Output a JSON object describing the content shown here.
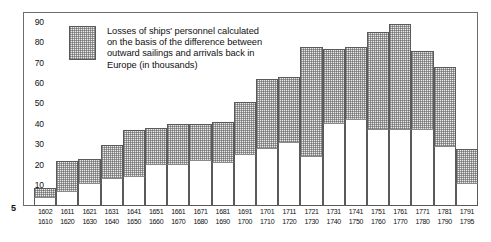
{
  "page_number": "5",
  "legend": {
    "swatch_name": "losses-swatch",
    "text": "Losses of ships' personnel calculated\non the basis of the difference between\noutward sailings and arrivals back in\nEurope (in thousands)"
  },
  "chart_data": {
    "type": "bar",
    "subtype": "stacked-bar",
    "title": "",
    "subtitle": "",
    "xlabel": "",
    "ylabel": "",
    "units": "thousands",
    "ylim": [
      0,
      95
    ],
    "yticks": [
      10,
      20,
      30,
      40,
      50,
      60,
      70,
      80,
      90
    ],
    "grid": false,
    "legend_position": "inside-top-left",
    "categories": [
      "1602\n1610",
      "1611\n1620",
      "1621\n1630",
      "1631\n1640",
      "1641\n1650",
      "1651\n1660",
      "1661\n1670",
      "1671\n1680",
      "1681\n1690",
      "1691\n1700",
      "1701\n1710",
      "1711\n1720",
      "1721\n1730",
      "1731\n1740",
      "1741\n1750",
      "1751\n1760",
      "1761\n1770",
      "1771\n1780",
      "1781\n1790",
      "1791\n1795"
    ],
    "categories_line1": [
      "1602",
      "1611",
      "1621",
      "1631",
      "1641",
      "1651",
      "1661",
      "1671",
      "1681",
      "1691",
      "1701",
      "1711",
      "1721",
      "1731",
      "1741",
      "1751",
      "1761",
      "1771",
      "1781",
      "1791"
    ],
    "categories_line2": [
      "1610",
      "1620",
      "1630",
      "1640",
      "1650",
      "1660",
      "1670",
      "1680",
      "1690",
      "1700",
      "1710",
      "1720",
      "1730",
      "1740",
      "1750",
      "1760",
      "1770",
      "1780",
      "1790",
      "1795"
    ],
    "series": [
      {
        "name": "arrivals back in Europe",
        "fill": "white",
        "values": [
          4,
          7,
          11,
          13,
          14,
          20,
          20,
          22,
          21,
          25,
          28,
          31,
          24,
          40,
          42,
          37,
          37,
          37,
          29,
          11
        ]
      },
      {
        "name": "Losses of ships' personnel",
        "fill": "stippled",
        "values": [
          5,
          15,
          12,
          17,
          23,
          18,
          20,
          18,
          20,
          26,
          34,
          32,
          54,
          37,
          36,
          48,
          52,
          39,
          39,
          17
        ]
      }
    ],
    "totals": [
      9,
      22,
      23,
      30,
      37,
      38,
      40,
      40,
      41,
      51,
      62,
      63,
      78,
      77,
      78,
      85,
      89,
      76,
      68,
      28
    ]
  }
}
